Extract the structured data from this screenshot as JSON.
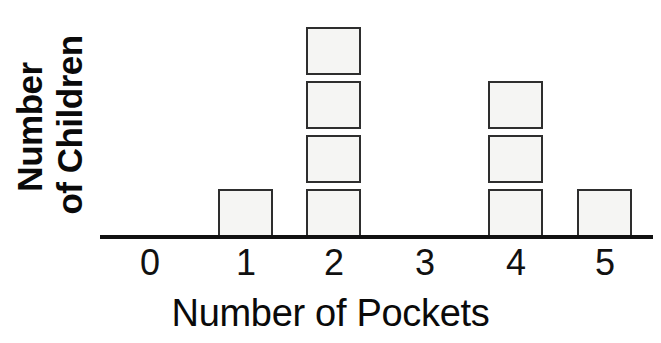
{
  "chart_data": {
    "type": "bar",
    "title": "",
    "subtitle": "",
    "xlabel": "Number of Pockets",
    "ylabel_line1": "Number",
    "ylabel_line2": "of Children",
    "ylabel": "Number of Children",
    "categories": [
      "0",
      "1",
      "2",
      "3",
      "4",
      "5"
    ],
    "values": [
      0,
      1,
      4,
      0,
      3,
      1
    ],
    "unit_block_label": "1 child",
    "ylim": [
      0,
      4
    ],
    "xlim": [
      0,
      5
    ],
    "grid": false,
    "legend": null,
    "annotations": [],
    "style": {
      "block_fill": "#f5f5f3",
      "block_border": "#2e2e2e",
      "axis_color": "#111111",
      "text_color": "#0a0a0a",
      "background": "#ffffff"
    },
    "columns": [
      {
        "category": "0",
        "count": 0,
        "center_x": 150
      },
      {
        "category": "1",
        "count": 1,
        "center_x": 246
      },
      {
        "category": "2",
        "count": 4,
        "center_x": 334
      },
      {
        "category": "3",
        "count": 0,
        "center_x": 425
      },
      {
        "category": "4",
        "count": 3,
        "center_x": 516
      },
      {
        "category": "5",
        "count": 1,
        "center_x": 605
      }
    ]
  }
}
